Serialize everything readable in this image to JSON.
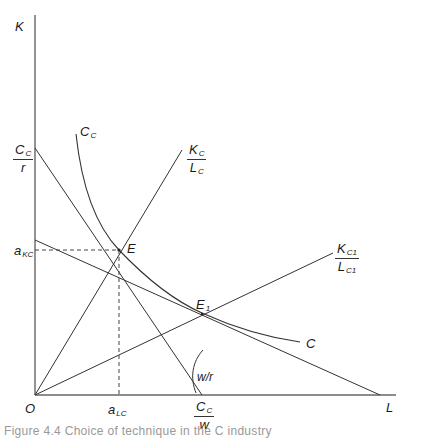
{
  "figure": {
    "caption": "Figure 4.4  Choice of technique in the C industry",
    "colors": {
      "line": "#333333",
      "axis": "#555555",
      "text": "#1a1a1a"
    }
  },
  "axes": {
    "y_label": "K",
    "x_label": "L",
    "origin_label": "O"
  },
  "labels": {
    "intercept_k": {
      "num": "C",
      "num_sub": "C",
      "den": "r"
    },
    "intercept_l": {
      "num": "C",
      "num_sub": "C",
      "den": "w"
    },
    "isoquant_top": {
      "main": "C",
      "sub": "C"
    },
    "isoquant_end": "C",
    "ray1": {
      "num": "K",
      "num_sub": "C",
      "den": "L",
      "den_sub": "C"
    },
    "ray2": {
      "num": "K",
      "num_sub": "C1",
      "den": "L",
      "den_sub": "C1"
    },
    "point_e": "E",
    "point_e1": {
      "main": "E",
      "sub": "1"
    },
    "a_kc": {
      "main": "a",
      "sub": "KC"
    },
    "a_lc": {
      "main": "a",
      "sub": "LC"
    },
    "angle": "w/r"
  },
  "geometry": {
    "origin": [
      35,
      395
    ],
    "y_axis_top": [
      35,
      15
    ],
    "x_axis_end": [
      395,
      395
    ],
    "budget_line_1": [
      [
        35,
        148
      ],
      [
        202,
        395
      ]
    ],
    "budget_line_2": [
      [
        35,
        240
      ],
      [
        380,
        395
      ]
    ],
    "ray_1_end": [
      182,
      150
    ],
    "ray_2_end": [
      333,
      253
    ],
    "point_E": [
      119,
      250
    ],
    "point_E1": [
      202,
      314
    ]
  }
}
